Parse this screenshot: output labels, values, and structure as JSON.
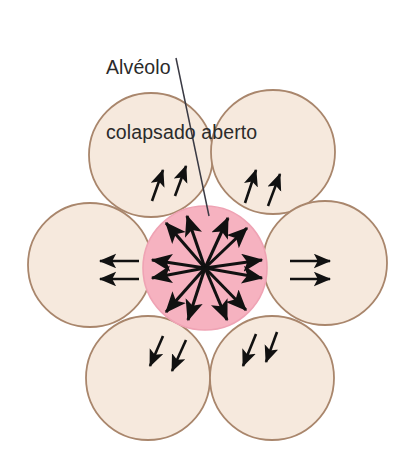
{
  "figure": {
    "name": "alveoli-interdependence-diagram",
    "background_color": "#ffffff",
    "width": 407,
    "height": 465,
    "annotation": {
      "line_1": "Alvéolo",
      "line_2": "colapsado aberto",
      "text_color": "#2b2b2b",
      "leader_line": {
        "from_x": 176,
        "from_y": 58,
        "to_x": 209,
        "to_y": 216,
        "color": "#3a3a44"
      }
    },
    "colors": {
      "alveolus_fill": "#f6e9dd",
      "alveolus_stroke": "#a9866c",
      "collapsed_fill": "#f6b2c0",
      "collapsed_stroke": "#e79aac",
      "arrow_color": "#111111"
    },
    "central_alveolus": {
      "label": "Alvéolo colapsado aberto",
      "state": "collapsado aberto",
      "cx": 205,
      "cy": 268,
      "r": 62,
      "fill": "#f6b2c0",
      "arrow_count": 8,
      "arrow_directions": [
        "NW",
        "N-NE",
        "W-upper",
        "W-lower",
        "E-upper",
        "E-lower",
        "SW",
        "SE"
      ]
    },
    "surrounding_alveoli": [
      {
        "id": "top-left",
        "cx": 151,
        "cy": 155,
        "r": 62,
        "arrow_count": 2,
        "arrow_direction": "up-right"
      },
      {
        "id": "top-right",
        "cx": 273,
        "cy": 152,
        "r": 62,
        "arrow_count": 2,
        "arrow_direction": "up-right"
      },
      {
        "id": "middle-left",
        "cx": 90,
        "cy": 265,
        "r": 62,
        "arrow_count": 2,
        "arrow_direction": "left"
      },
      {
        "id": "middle-right",
        "cx": 325,
        "cy": 263,
        "r": 62,
        "arrow_count": 2,
        "arrow_direction": "right"
      },
      {
        "id": "bottom-left",
        "cx": 148,
        "cy": 378,
        "r": 62,
        "arrow_count": 2,
        "arrow_direction": "down-left"
      },
      {
        "id": "bottom-right",
        "cx": 272,
        "cy": 378,
        "r": 62,
        "arrow_count": 2,
        "arrow_direction": "down-left"
      }
    ]
  }
}
